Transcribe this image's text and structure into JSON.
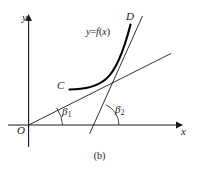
{
  "figure": {
    "caption": "(b)",
    "axes": {
      "x_label": "x",
      "y_label": "y",
      "origin_label": "O"
    },
    "labels": {
      "function_prefix": "y",
      "function_equals": "=",
      "function_name": "f",
      "function_open": "(",
      "function_var": "x",
      "function_close": ")",
      "point_c": "C",
      "point_d": "D",
      "angle_1_symbol": "β",
      "angle_1_subscript": "1",
      "angle_2_symbol": "β",
      "angle_2_subscript": "2"
    },
    "colors": {
      "stroke": "#1a1a1a",
      "curve": "#000000",
      "background": "#ffffff"
    },
    "geometry": {
      "origin_px": [
        28,
        125
      ],
      "x_axis_from": [
        8,
        125
      ],
      "x_axis_to": [
        178,
        125
      ],
      "y_axis_from": [
        28,
        146
      ],
      "y_axis_to": [
        28,
        15
      ],
      "secant_from": [
        29,
        125
      ],
      "secant_to": [
        170,
        54
      ],
      "tangent_from": [
        90,
        133
      ],
      "tangent_to": [
        142,
        17
      ],
      "curve_start_c": [
        69,
        89
      ],
      "curve_end_d": [
        133,
        24
      ],
      "tangent_x_intercept": [
        97,
        125
      ],
      "arc_beta1_radius": 34,
      "arc_beta2_radius": 22
    }
  }
}
